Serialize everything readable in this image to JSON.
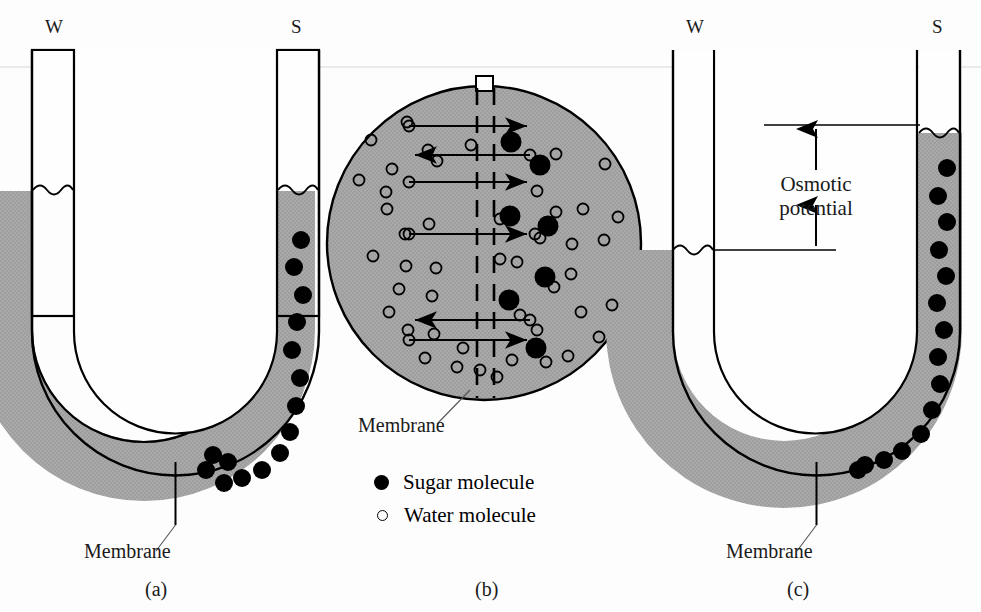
{
  "figure": {
    "background_color": "#fdfdfd",
    "liquid_fill_color": "#a8a8a8",
    "outline_color": "#000000",
    "sugar_color": "#000000",
    "water_outline_color": "#000000"
  },
  "panel_a": {
    "caption": "(a)",
    "left_tube_letter": "W",
    "right_tube_letter": "S",
    "membrane_label": "Membrane",
    "water_level_left_y": 190,
    "water_level_right_y": 190,
    "sugar_molecule_count": 15,
    "sugar_positions": [
      [
        301,
        240
      ],
      [
        294,
        267
      ],
      [
        303,
        295
      ],
      [
        297,
        322
      ],
      [
        292,
        350
      ],
      [
        300,
        378
      ],
      [
        296,
        406
      ],
      [
        290,
        432
      ],
      [
        280,
        453
      ],
      [
        262,
        470
      ],
      [
        242,
        478
      ],
      [
        224,
        483
      ],
      [
        206,
        470
      ],
      [
        213,
        455
      ],
      [
        228,
        462
      ]
    ]
  },
  "panel_b": {
    "caption": "(b)",
    "membrane_label": "Membrane",
    "membrane_style": "dashed vertical double line",
    "circle_center": [
      484,
      243
    ],
    "circle_radius": 157,
    "neck": {
      "x": 476,
      "y": 76,
      "width": 17,
      "height": 14
    },
    "arrows": [
      {
        "direction": "right",
        "from_x": 409,
        "to_x": 527,
        "y": 126
      },
      {
        "direction": "left",
        "from_x": 530,
        "to_x": 415,
        "y": 155
      },
      {
        "direction": "right",
        "from_x": 409,
        "to_x": 527,
        "y": 182
      },
      {
        "direction": "right",
        "from_x": 409,
        "to_x": 527,
        "y": 234
      },
      {
        "direction": "left",
        "from_x": 530,
        "to_x": 415,
        "y": 320
      },
      {
        "direction": "right",
        "from_x": 409,
        "to_x": 527,
        "y": 340
      }
    ],
    "sugar_positions": [
      [
        511,
        142
      ],
      [
        540,
        165
      ],
      [
        548,
        226
      ],
      [
        510,
        216
      ],
      [
        545,
        277
      ],
      [
        509,
        300
      ],
      [
        536,
        348
      ]
    ],
    "water_positions": [
      [
        407,
        122
      ],
      [
        371,
        140
      ],
      [
        392,
        169
      ],
      [
        386,
        192
      ],
      [
        359,
        180
      ],
      [
        428,
        150
      ],
      [
        437,
        161
      ],
      [
        556,
        154
      ],
      [
        605,
        164
      ],
      [
        387,
        209
      ],
      [
        429,
        224
      ],
      [
        405,
        234
      ],
      [
        556,
        212
      ],
      [
        618,
        217
      ],
      [
        583,
        209
      ],
      [
        373,
        256
      ],
      [
        406,
        266
      ],
      [
        436,
        268
      ],
      [
        500,
        219
      ],
      [
        471,
        145
      ],
      [
        537,
        191
      ],
      [
        535,
        234
      ],
      [
        540,
        238
      ],
      [
        572,
        244
      ],
      [
        399,
        289
      ],
      [
        432,
        296
      ],
      [
        571,
        274
      ],
      [
        500,
        259
      ],
      [
        517,
        262
      ],
      [
        554,
        287
      ],
      [
        604,
        240
      ],
      [
        389,
        312
      ],
      [
        434,
        334
      ],
      [
        408,
        330
      ],
      [
        463,
        348
      ],
      [
        520,
        315
      ],
      [
        537,
        330
      ],
      [
        581,
        312
      ],
      [
        612,
        305
      ],
      [
        599,
        337
      ],
      [
        425,
        358
      ],
      [
        457,
        367
      ],
      [
        512,
        360
      ],
      [
        546,
        362
      ],
      [
        568,
        356
      ],
      [
        480,
        370
      ],
      [
        497,
        377
      ]
    ]
  },
  "panel_c": {
    "caption": "(c)",
    "left_tube_letter": "W",
    "right_tube_letter": "S",
    "membrane_label": "Membrane",
    "osmotic_label_line1": "Osmotic",
    "osmotic_label_line2": "potential",
    "water_level_left_y": 250,
    "water_level_right_y": 133,
    "measure_top_y": 125,
    "measure_bottom_y": 250,
    "sugar_molecule_count": 15,
    "sugar_positions": [
      [
        947,
        168
      ],
      [
        938,
        196
      ],
      [
        947,
        222
      ],
      [
        939,
        250
      ],
      [
        946,
        276
      ],
      [
        937,
        303
      ],
      [
        944,
        330
      ],
      [
        938,
        357
      ],
      [
        940,
        384
      ],
      [
        932,
        410
      ],
      [
        921,
        434
      ],
      [
        902,
        451
      ],
      [
        884,
        460
      ],
      [
        865,
        465
      ],
      [
        858,
        470
      ]
    ]
  },
  "legend": {
    "items": [
      {
        "marker": "filled-circle",
        "label": "Sugar molecule"
      },
      {
        "marker": "open-circle",
        "label": "Water molecule"
      }
    ]
  }
}
